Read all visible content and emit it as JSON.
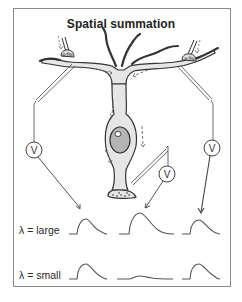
{
  "figure": {
    "title": "Spatial summation",
    "voltmeter_label": "V",
    "rows": [
      {
        "label": "λ = large",
        "key": "large"
      },
      {
        "label": "λ = small",
        "key": "small"
      }
    ],
    "recording_sites": [
      "distal-left-dendrite",
      "soma",
      "distal-right-dendrite"
    ],
    "colors": {
      "neuron_fill": "#e6e6e6",
      "nucleus_fill": "#b5b5b5",
      "outline": "#333333",
      "frame": "#8a8a8a",
      "current_arrows": "#666666"
    }
  }
}
